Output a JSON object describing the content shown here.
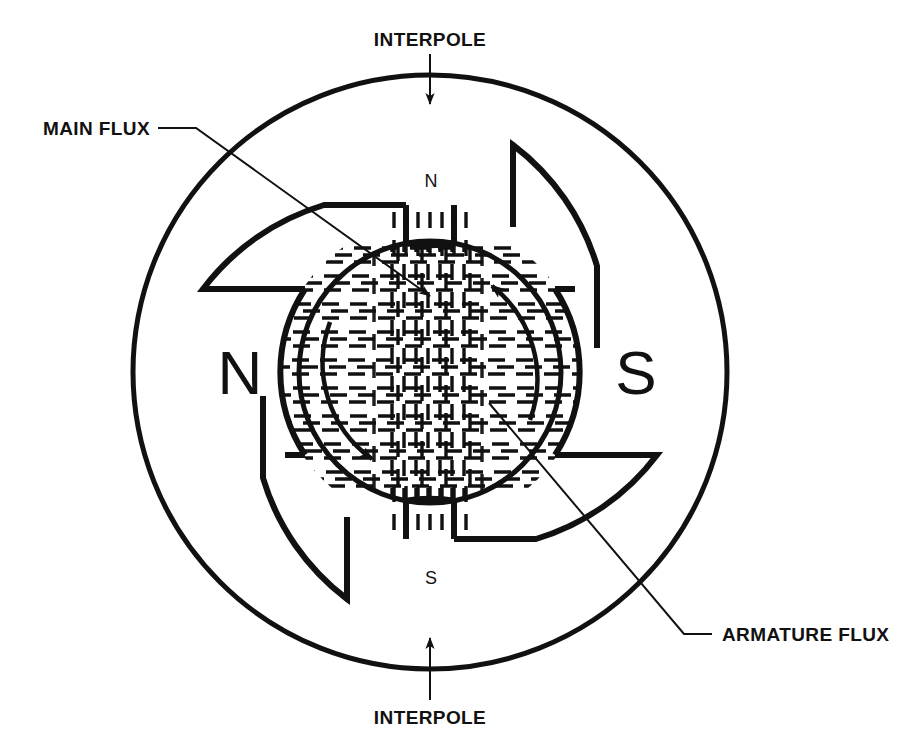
{
  "diagram": {
    "background_color": "#ffffff",
    "ink_color": "#111111"
  },
  "callouts": {
    "interpole_top": "INTERPOLE",
    "interpole_bottom": "INTERPOLE",
    "main_flux": "MAIN FLUX",
    "armature_flux": "ARMATURE FLUX"
  },
  "poles": {
    "main_left": "N",
    "main_right": "S",
    "interpole_top": "N",
    "interpole_bottom": "S"
  },
  "icons": {
    "interpole_top_arrow": "arrow-down-icon",
    "interpole_bottom_arrow": "arrow-up-icon",
    "main_flux_pointer": "leader-arrow-icon",
    "armature_flux_pointer": "leader-line-icon",
    "rotation_arrow_upper": "curved-arrow-icon",
    "rotation_arrow_lower": "curved-arrow-icon"
  },
  "geometry": {
    "frame_center_x": 430,
    "frame_center_y": 372,
    "frame_outer_radius": 297,
    "frame_inner_radius": 247,
    "armature_radius": 131,
    "pole_gap_radius": 152
  },
  "hatching": {
    "main_flux_direction": "horizontal",
    "armature_flux_direction": "vertical",
    "main_flux_note": "horizontal dashed lines, N pole to S pole",
    "armature_flux_note": "vertical dashed band through armature"
  }
}
